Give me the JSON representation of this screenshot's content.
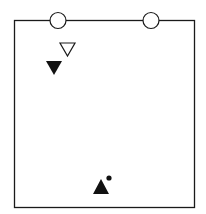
{
  "diagram": {
    "type": "drill-field-diagram",
    "colors": {
      "line": "#1a1a1a",
      "background": "#ffffff",
      "fill": "#111111"
    },
    "elements": [
      {
        "name": "cone-left",
        "kind": "circle-marker"
      },
      {
        "name": "cone-right",
        "kind": "circle-marker"
      },
      {
        "name": "defender-open",
        "kind": "hollow-triangle-down"
      },
      {
        "name": "player-filled-down",
        "kind": "filled-triangle-down"
      },
      {
        "name": "player-with-ball",
        "kind": "filled-triangle-up"
      },
      {
        "name": "ball",
        "kind": "dot"
      }
    ]
  }
}
